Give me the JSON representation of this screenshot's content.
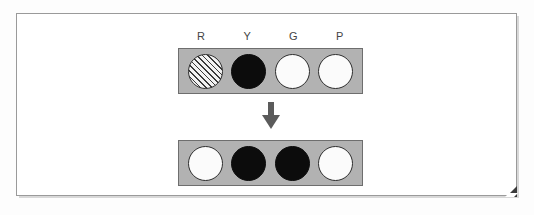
{
  "figure": {
    "type": "peg-row-transformation-diagram",
    "column_labels": [
      "R",
      "Y",
      "G",
      "P"
    ],
    "rows": [
      {
        "name": "top-row",
        "pegs": [
          {
            "label": "R",
            "fill": "hatched"
          },
          {
            "label": "Y",
            "fill": "black"
          },
          {
            "label": "G",
            "fill": "white"
          },
          {
            "label": "P",
            "fill": "white"
          }
        ]
      },
      {
        "name": "bottom-row",
        "pegs": [
          {
            "label": "R",
            "fill": "white"
          },
          {
            "label": "Y",
            "fill": "black"
          },
          {
            "label": "G",
            "fill": "black"
          },
          {
            "label": "P",
            "fill": "white"
          }
        ]
      }
    ],
    "arrow": {
      "direction": "down",
      "glyph": "down-arrow"
    }
  },
  "colors": {
    "bar_fill": "#b2b2b2",
    "bar_border": "#6e6e6e",
    "peg_white": "#fbfbfb",
    "peg_black": "#0c0c0c",
    "peg_hatch_line": "#3a3a3a",
    "peg_border": "#2e2e2e",
    "arrow": "#5b5b5b",
    "frame_border": "#9a9a9a",
    "page_background": "#ffffff",
    "curl": "#3a3a3a"
  }
}
